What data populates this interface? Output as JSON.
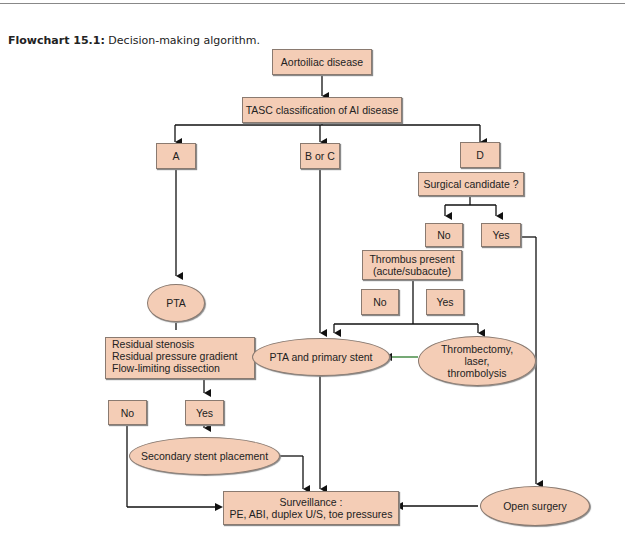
{
  "caption": {
    "label": "Flowchart 15.1:",
    "text": " Decision-making algorithm."
  },
  "nodes": {
    "aortoiliac": "Aortoiliac disease",
    "tasc": "TASC classification of AI disease",
    "a": "A",
    "boc": "B or C",
    "d": "D",
    "surgical": "Surgical candidate ?",
    "surg_no": "No",
    "surg_yes": "Yes",
    "thrombus_1": "Thrombus present",
    "thrombus_2": "(acute/subacute)",
    "thr_no": "No",
    "thr_yes": "Yes",
    "pta": "PTA",
    "residual_1": "Residual stenosis",
    "residual_2": "Residual pressure gradient",
    "residual_3": "Flow-limiting dissection",
    "pta_stent": "PTA and primary stent",
    "thrombectomy_1": "Thrombectomy,",
    "thrombectomy_2": "laser,",
    "thrombectomy_3": "thrombolysis",
    "res_no": "No",
    "res_yes": "Yes",
    "secondary": "Secondary stent placement",
    "surveillance_1": "Surveillance :",
    "surveillance_2": "PE, ABI, duplex U/S, toe pressures",
    "open_surgery": "Open surgery"
  },
  "colors": {
    "node_fill": "#f4cdb6",
    "line": "#111111",
    "green_arrow": "#2a7a2a"
  }
}
